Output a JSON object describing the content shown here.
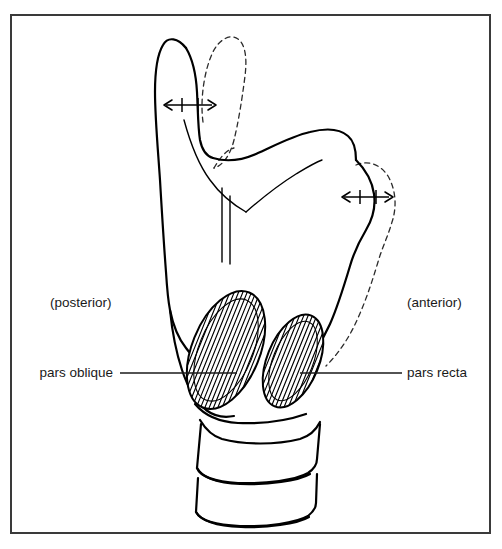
{
  "figure": {
    "domain": "anatomical-line-diagram",
    "page": {
      "width": 502,
      "height": 549,
      "background_color": "#ffffff"
    },
    "frame": {
      "name": "figure-border",
      "x": 11,
      "y": 15,
      "width": 479,
      "height": 518,
      "stroke_color": "#3a3a3a",
      "stroke_width": 2
    },
    "colors": {
      "ink": "#000000",
      "text": "#1a1a1a",
      "dashed_ink": "#2b2b2b",
      "frame": "#3a3a3a",
      "paper": "#ffffff"
    },
    "orientation_labels": [
      {
        "id": "posterior",
        "text": "(posterior)",
        "x": 50,
        "y": 307,
        "anchor": "start"
      },
      {
        "id": "anterior",
        "text": "(anterior)",
        "x": 407,
        "y": 307,
        "anchor": "start"
      }
    ],
    "structure_labels": [
      {
        "id": "pars-oblique",
        "text": "pars oblique",
        "x": 113,
        "y": 377,
        "anchor": "end",
        "leader": {
          "x1": 120,
          "y1": 373,
          "x2": 237,
          "y2": 373,
          "side": "left"
        }
      },
      {
        "id": "pars-recta",
        "text": "pars recta",
        "x": 407,
        "y": 377,
        "anchor": "start",
        "leader": {
          "x1": 300,
          "y1": 373,
          "x2": 402,
          "y2": 373,
          "side": "right"
        }
      }
    ],
    "measurement_arrows": [
      {
        "id": "superior-cornu-excursion",
        "description": "double-headed arrow with two tick marks at superior thyroid cornu",
        "x1": 163,
        "x2": 215,
        "y": 105,
        "ticks": [
          182,
          198
        ]
      },
      {
        "id": "inferior-cornu-excursion",
        "description": "double-headed arrow with two tick marks at inferior thyroid cornu",
        "x1": 341,
        "x2": 392,
        "y": 197,
        "ticks": [
          360,
          376
        ]
      }
    ],
    "muscles": [
      {
        "id": "pars-oblique-belly",
        "label": "pars oblique",
        "shape": "ellipse",
        "cx": 226,
        "cy": 350,
        "rx": 34,
        "ry": 62,
        "rotation_deg": 22,
        "hatch_count": 17,
        "fill": "#ffffff"
      },
      {
        "id": "pars-recta-belly",
        "label": "pars recta",
        "shape": "ellipse",
        "cx": 293,
        "cy": 361,
        "rx": 26,
        "ry": 49,
        "rotation_deg": 22,
        "hatch_count": 14,
        "fill": "#ffffff"
      }
    ],
    "anatomy_parts": [
      {
        "id": "thyroid-cartilage",
        "label": "thyroid cartilage",
        "style": "solid"
      },
      {
        "id": "superior-cornu",
        "label": "superior cornu",
        "style": "solid"
      },
      {
        "id": "inferior-cornu",
        "label": "inferior cornu",
        "style": "solid"
      },
      {
        "id": "thyroid-lamina-ridge",
        "label": "oblique line of thyroid lamina",
        "style": "inner"
      },
      {
        "id": "cricoid-cartilage",
        "label": "cricoid cartilage",
        "style": "solid"
      },
      {
        "id": "tracheal-ring-1",
        "label": "first tracheal ring",
        "style": "solid"
      },
      {
        "id": "tracheal-ring-2",
        "label": "second tracheal ring",
        "style": "solid"
      },
      {
        "id": "displaced-superior-cornu",
        "label": "displaced superior cornu position",
        "style": "dashed"
      },
      {
        "id": "displaced-inferior-cornu",
        "label": "displaced inferior cornu position",
        "style": "dashed"
      }
    ]
  }
}
